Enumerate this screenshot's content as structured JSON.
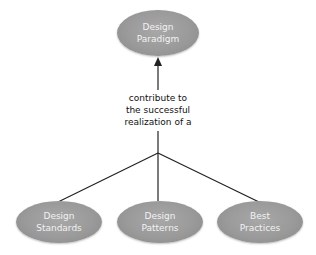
{
  "diagram": {
    "type": "hierarchy",
    "top_node": {
      "label": "Design\nParadigm"
    },
    "edge_label": "contribute to\nthe successful\nrealization of a",
    "bottom_nodes": [
      {
        "label": "Design\nStandards"
      },
      {
        "label": "Design\nPatterns"
      },
      {
        "label": "Best\nPractices"
      }
    ],
    "colors": {
      "node_fill": "#9a9a9a",
      "node_text": "#f2f2f2",
      "line": "#222222",
      "label_text": "#111111"
    }
  }
}
